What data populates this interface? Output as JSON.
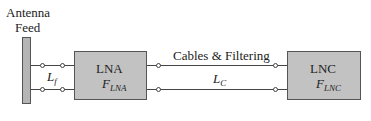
{
  "diagram": {
    "antenna_label_line1": "Antenna",
    "antenna_label_line2": "Feed",
    "feed_loss": {
      "symbol": "L",
      "subscript": "f"
    },
    "lna": {
      "title": "LNA",
      "noise_symbol": "F",
      "noise_subscript": "LNA"
    },
    "cables": {
      "title": "Cables & Filtering",
      "symbol": "L",
      "subscript": "C"
    },
    "lnc": {
      "title": "LNC",
      "noise_symbol": "F",
      "noise_subscript": "LNC"
    },
    "colors": {
      "box_fill": "#c2c2c2",
      "feed_fill": "#b5b5b5",
      "line": "#444444"
    }
  }
}
